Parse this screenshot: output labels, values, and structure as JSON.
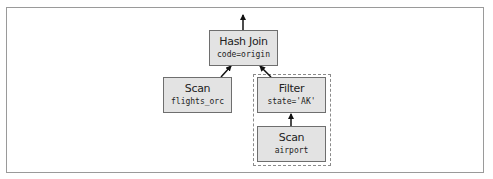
{
  "diagram": {
    "nodes": [
      {
        "id": "hash_join",
        "title": "Hash Join",
        "detail": "code=origin"
      },
      {
        "id": "scan_flights",
        "title": "Scan",
        "detail": "flights_orc"
      },
      {
        "id": "filter",
        "title": "Filter",
        "detail": "state='AK'"
      },
      {
        "id": "scan_airport",
        "title": "Scan",
        "detail": "airport"
      }
    ],
    "edges": [
      {
        "from": "hash_join",
        "to": "output"
      },
      {
        "from": "scan_flights",
        "to": "hash_join"
      },
      {
        "from": "filter",
        "to": "hash_join"
      },
      {
        "from": "scan_airport",
        "to": "filter"
      }
    ],
    "groups": [
      {
        "id": "pushdown_group",
        "members": [
          "filter",
          "scan_airport"
        ],
        "style": "dashed"
      }
    ]
  }
}
